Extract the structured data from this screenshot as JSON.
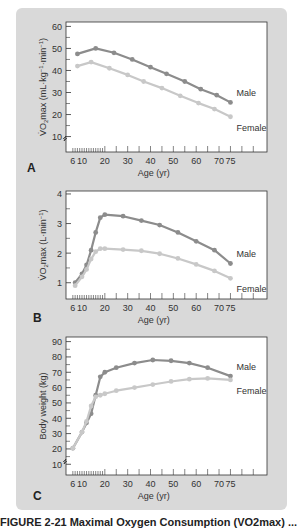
{
  "caption": "FIGURE 2-21  Maximal Oxygen Consumption (VO2max) ...",
  "x_axis": {
    "label": "Age (yr)",
    "ticks": [
      6,
      10,
      20,
      30,
      40,
      50,
      60,
      70,
      75
    ],
    "minor_ticks": [
      6,
      7,
      8,
      9,
      10,
      11,
      12,
      13,
      14,
      15,
      16,
      17,
      18,
      19,
      20,
      25,
      30,
      35,
      40,
      45,
      50,
      55,
      60,
      65,
      70,
      75,
      80,
      85
    ],
    "range": [
      3,
      91
    ]
  },
  "colors": {
    "male": "#8c8c8c",
    "female": "#c8c8c8",
    "panel": "#d9d9d9",
    "plot_bg": "#ffffff",
    "axis": "#333333"
  },
  "chart_data": [
    {
      "panel_label": "A",
      "type": "line",
      "title": "",
      "xlabel": "Age (yr)",
      "ylabel": "VO2max (mL·kg-1·min-1)",
      "ylabel_parts": {
        "main": "V̇O",
        "sub": "2",
        "rest": "max (mL·kg",
        "sup1": "−1",
        "mid": "·min",
        "sup2": "−1",
        "end": ")"
      },
      "yticks": [
        10,
        20,
        30,
        40,
        50,
        60
      ],
      "ylim": [
        3,
        62
      ],
      "axis_break": true,
      "series": [
        {
          "name": "Male",
          "x": [
            8,
            16,
            24,
            32,
            40,
            47,
            55,
            62,
            69,
            75
          ],
          "values": [
            47.5,
            50,
            48,
            45,
            41.5,
            38.5,
            35,
            31.5,
            28.8,
            25.5
          ]
        },
        {
          "name": "Female",
          "x": [
            8,
            14,
            22,
            30,
            37,
            45,
            53,
            61,
            68,
            75
          ],
          "values": [
            42,
            43.8,
            41,
            38,
            35,
            32,
            28.5,
            25.2,
            22.5,
            19
          ]
        }
      ],
      "legend": [
        "Male",
        "Female"
      ],
      "grid": false
    },
    {
      "panel_label": "B",
      "type": "line",
      "title": "",
      "xlabel": "Age (yr)",
      "ylabel": "VO2max (L·min-1)",
      "ylabel_parts": {
        "main": "V̇O",
        "sub": "2",
        "rest": "max (L·min",
        "sup1": "−1",
        "mid": "",
        "sup2": "",
        "end": ")"
      },
      "yticks": [
        1,
        2,
        3,
        4
      ],
      "ylim": [
        0.45,
        4.1
      ],
      "axis_break": false,
      "series": [
        {
          "name": "Male",
          "x": [
            7,
            10,
            12,
            14,
            16,
            18,
            20,
            28,
            36,
            44,
            52,
            60,
            68,
            75
          ],
          "values": [
            1.0,
            1.3,
            1.6,
            2.1,
            2.7,
            3.2,
            3.3,
            3.25,
            3.1,
            2.95,
            2.7,
            2.4,
            2.1,
            1.65
          ]
        },
        {
          "name": "Female",
          "x": [
            7,
            10,
            12,
            14,
            16,
            18,
            20,
            28,
            36,
            44,
            52,
            60,
            68,
            75
          ],
          "values": [
            0.9,
            1.2,
            1.45,
            1.8,
            2.05,
            2.15,
            2.15,
            2.12,
            2.08,
            1.98,
            1.82,
            1.62,
            1.4,
            1.15
          ]
        }
      ],
      "legend": [
        "Male",
        "Female"
      ],
      "grid": false
    },
    {
      "panel_label": "C",
      "type": "line",
      "title": "",
      "xlabel": "Age (yr)",
      "ylabel": "Body weight (kg)",
      "ylabel_parts": {
        "main": "Body weight (kg)",
        "sub": "",
        "rest": "",
        "sup1": "",
        "mid": "",
        "sup2": "",
        "end": ""
      },
      "yticks": [
        10,
        20,
        30,
        40,
        50,
        60,
        70,
        80,
        90
      ],
      "ylim": [
        3,
        93
      ],
      "axis_break": true,
      "series": [
        {
          "name": "Male",
          "x": [
            6,
            10,
            12,
            14,
            16,
            18,
            20,
            25,
            33,
            41,
            49,
            57,
            65,
            75
          ],
          "values": [
            20.5,
            31,
            37,
            43,
            55,
            67,
            70,
            73,
            76,
            78,
            77.5,
            76,
            73,
            67.5
          ]
        },
        {
          "name": "Female",
          "x": [
            6,
            10,
            12,
            14,
            16,
            18,
            20,
            25,
            33,
            41,
            49,
            57,
            65,
            75
          ],
          "values": [
            20.5,
            31,
            38,
            48,
            54,
            55,
            56,
            58,
            60,
            62,
            64,
            65.5,
            66,
            65
          ]
        }
      ],
      "legend": [
        "Male",
        "Female"
      ],
      "grid": false
    }
  ]
}
